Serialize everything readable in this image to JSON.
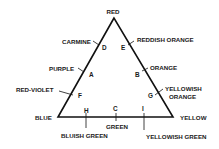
{
  "diagram": {
    "type": "color-triangle",
    "vertices": {
      "top": {
        "label": "RED"
      },
      "left": {
        "label": "BLUE"
      },
      "right": {
        "label": "YELLOW"
      }
    },
    "left_side": [
      {
        "letter": "D",
        "label": "CARMINE"
      },
      {
        "letter": "A",
        "label": "PURPLE"
      },
      {
        "letter": "F",
        "label": "RED-VIOLET"
      }
    ],
    "right_side": [
      {
        "letter": "E",
        "label": "REDDISH ORANGE"
      },
      {
        "letter": "B",
        "label": "ORANGE"
      },
      {
        "letter": "G",
        "label_line1": "YELLOWISH",
        "label_line2": "ORANGE"
      }
    ],
    "bottom_side": [
      {
        "letter": "H",
        "label": "BLUISH GREEN"
      },
      {
        "letter": "C",
        "label": "GREEN"
      },
      {
        "letter": "I",
        "label": "YELLOWISH GREEN"
      }
    ],
    "colors": {
      "line": "#111111",
      "text": "#1a1a1a",
      "background": "#ffffff"
    }
  }
}
